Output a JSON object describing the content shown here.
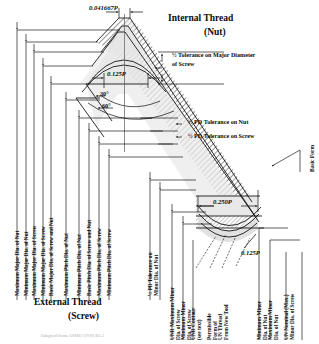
{
  "figure": {
    "kind": "engineering-diagram",
    "titles": {
      "internal_line1": "Internal Thread",
      "internal_line2": "(Nut)",
      "external_line1": "External Thread",
      "external_line2": "(Screw)"
    },
    "footnote": "Adapted from ASME/ANSI B1.1"
  },
  "dimensions": {
    "crest_flat": "0.041667P",
    "nut_crest_flat": "0.125P",
    "root_flat": "0.250P",
    "screw_root_flat": "0.125P",
    "half_angle": "30°",
    "full_angle": "60°"
  },
  "callouts": {
    "major_tol": {
      "line1": "½ Tolerance on Major Diameter",
      "line2": "of Screw"
    },
    "pd_tol_nut": "½ PD Tolerance on Nut",
    "pd_tol_screw": "½ PD Tolerance on Screw",
    "basic_form": "Basic Form",
    "unr_contour": {
      "line1": "UNR Contour",
      "line2": "(see text)"
    },
    "permissible_form": {
      "line1": "Permissible",
      "line2": "Form of",
      "line3": "UN Thread",
      "line4": "From New Tool"
    }
  },
  "left_labels": [
    "Maximum Major Dia. of Nut",
    "Minimum Major Dia. of Nut",
    "Maximum Major Dia. of Screw",
    "Minimum Major Dia. of Screw",
    "Basic Major Dia. of Screw and Nut"
  ],
  "mid_labels": [
    "Maximum Pitch Dia. of Nut",
    "Minimum Pitch Dia. of Nut",
    "Basic Pitch Dia. of Screw and Nut",
    "Maximum Pitch Dia. of Screw",
    "Minimum Pitch Dia. of Screw"
  ],
  "mid_right_labels": [
    {
      "line1": "½ PD Tolerance on",
      "line2": "Minor Dia. of Nut"
    }
  ],
  "right_labels": [
    {
      "line1": "UNR Maximum Minor",
      "line2": "Dia. of Screw"
    },
    {
      "line1": "Minimum Minor",
      "line2": "Dia. of Screw"
    },
    {
      "line1": "UNR Contour",
      "line2": "(see text)"
    },
    {
      "line1": "Permissible",
      "line2": "Form of",
      "line3": "UN Thread",
      "line4": "From New Tool"
    },
    {
      "line1": "Minimum Minor",
      "line2": "Dia. of Nut"
    },
    {
      "line1": "Maximum Minor",
      "line2": "Dia. of Nut"
    },
    {
      "line1": "UN Nominal (Max.)",
      "line2": "Minor Dia. of Screw"
    }
  ],
  "colors": {
    "ink": "#0b0b0b",
    "hatch": "#7a7a7a",
    "fill_light": "#e3e3e3",
    "fill_mid": "#cfcfcf",
    "paper": "#ffffff"
  }
}
